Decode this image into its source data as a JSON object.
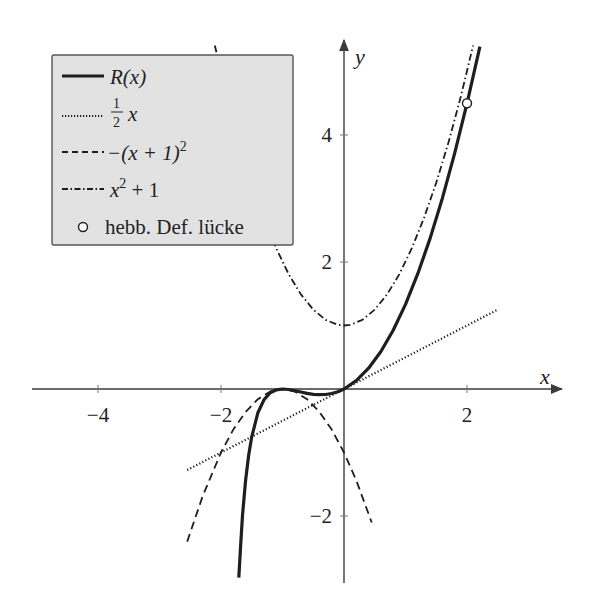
{
  "chart_data": {
    "type": "line",
    "title": "",
    "xlabel": "x",
    "ylabel": "y",
    "xlim": [
      -5.0,
      3.5
    ],
    "ylim": [
      -3.0,
      5.6
    ],
    "x_ticks": [
      -4,
      -2,
      2
    ],
    "x_tick_labels": [
      "−4",
      "−2",
      "2"
    ],
    "y_ticks": [
      -2,
      2,
      4
    ],
    "y_tick_labels": [
      "−2",
      "2",
      "4"
    ],
    "grid": false,
    "legend_position": "upper left",
    "series": [
      {
        "name": "R(x)",
        "style": "solid-thick",
        "points": [
          [
            -1.71,
            -2.97
          ],
          [
            -1.68,
            -2.45
          ],
          [
            -1.65,
            -1.99
          ],
          [
            -1.6,
            -1.44
          ],
          [
            -1.55,
            -1.04
          ],
          [
            -1.5,
            -0.75
          ],
          [
            -1.4,
            -0.373
          ],
          [
            -1.3,
            -0.167
          ],
          [
            -1.2,
            -0.06
          ],
          [
            -1.1,
            -0.012
          ],
          [
            -1.0,
            0.0
          ],
          [
            -0.9,
            -0.008
          ],
          [
            -0.8,
            -0.027
          ],
          [
            -0.7,
            -0.048
          ],
          [
            -0.6,
            -0.069
          ],
          [
            -0.5,
            -0.083
          ],
          [
            -0.4,
            -0.09
          ],
          [
            -0.3,
            -0.086
          ],
          [
            -0.2,
            -0.071
          ],
          [
            -0.1,
            -0.043
          ],
          [
            0.0,
            0.0
          ],
          [
            0.2,
            0.131
          ],
          [
            0.4,
            0.327
          ],
          [
            0.6,
            0.591
          ],
          [
            0.8,
            0.926
          ],
          [
            1.0,
            1.333
          ],
          [
            1.2,
            1.815
          ],
          [
            1.4,
            2.372
          ],
          [
            1.6,
            3.004
          ],
          [
            1.8,
            3.714
          ],
          [
            2.0,
            4.5
          ],
          [
            2.1,
            4.92
          ],
          [
            2.21,
            5.39
          ]
        ]
      },
      {
        "name": "1/2 x",
        "style": "dotted",
        "points": [
          [
            -2.55,
            -1.275
          ],
          [
            2.5,
            1.25
          ]
        ]
      },
      {
        "name": "-(x+1)^2",
        "style": "dashed",
        "points": [
          [
            -2.55,
            -2.4025
          ],
          [
            -2.3,
            -1.69
          ],
          [
            -2.0,
            -1.0
          ],
          [
            -1.8,
            -0.64
          ],
          [
            -1.6,
            -0.36
          ],
          [
            -1.4,
            -0.16
          ],
          [
            -1.2,
            -0.04
          ],
          [
            -1.0,
            0.0
          ],
          [
            -0.8,
            -0.04
          ],
          [
            -0.6,
            -0.16
          ],
          [
            -0.4,
            -0.36
          ],
          [
            -0.2,
            -0.64
          ],
          [
            0.0,
            -1.0
          ],
          [
            0.2,
            -1.44
          ],
          [
            0.45,
            -2.1025
          ]
        ]
      },
      {
        "name": "x^2 + 1",
        "style": "dashdot",
        "points": [
          [
            -2.1,
            5.41
          ],
          [
            -1.9,
            4.61
          ],
          [
            -1.7,
            3.89
          ],
          [
            -1.5,
            3.25
          ],
          [
            -1.3,
            2.69
          ],
          [
            -1.1,
            2.21
          ],
          [
            -0.9,
            1.81
          ],
          [
            -0.7,
            1.49
          ],
          [
            -0.5,
            1.25
          ],
          [
            -0.3,
            1.09
          ],
          [
            -0.1,
            1.01
          ],
          [
            0.0,
            1.0
          ],
          [
            0.1,
            1.01
          ],
          [
            0.3,
            1.09
          ],
          [
            0.5,
            1.25
          ],
          [
            0.7,
            1.49
          ],
          [
            0.9,
            1.81
          ],
          [
            1.1,
            2.21
          ],
          [
            1.3,
            2.69
          ],
          [
            1.5,
            3.25
          ],
          [
            1.7,
            3.89
          ],
          [
            1.9,
            4.61
          ],
          [
            2.1,
            5.41
          ]
        ]
      }
    ],
    "markers": [
      {
        "name": "hebb. Def. lücke",
        "type": "open-circle",
        "x": 2.0,
        "y": 4.5
      }
    ]
  },
  "legend": {
    "items": [
      {
        "label_main": "R(x)",
        "style": "solid-thick"
      },
      {
        "label_main": "x",
        "label_frac_num": "1",
        "label_frac_den": "2",
        "style": "dotted"
      },
      {
        "label_main": "−(x + 1)",
        "label_sup": "2",
        "style": "dashed"
      },
      {
        "label_main": "x",
        "label_sup": "2",
        "label_tail": " + 1",
        "style": "dashdot"
      },
      {
        "label_main": "hebb. Def. lücke",
        "style": "open-circle"
      }
    ]
  },
  "axes": {
    "x_label": "x",
    "y_label": "y"
  },
  "colors": {
    "ink": "#1e1e1e",
    "axis": "#3a3a3a",
    "legend_bg": "#e2e2e2",
    "legend_border": "#555555",
    "background": "#ffffff"
  }
}
